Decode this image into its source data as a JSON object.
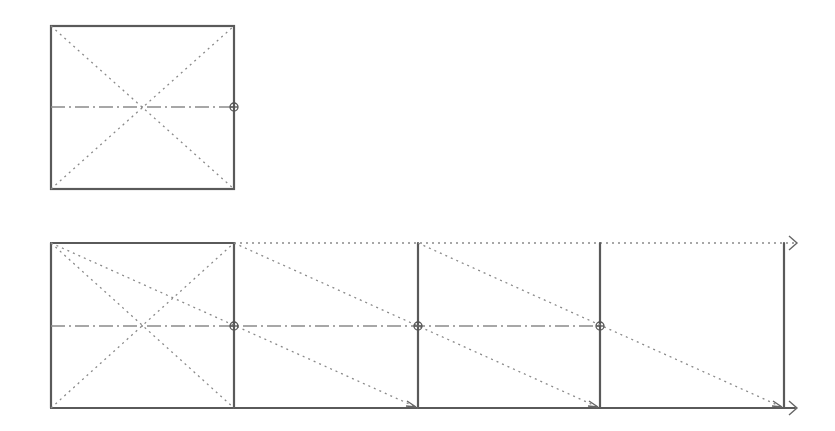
{
  "diagram": {
    "top_figure": {
      "label": "",
      "elements": [
        "square-outline",
        "diagonal-1",
        "diagonal-2",
        "center-line",
        "midpoint-marker"
      ]
    },
    "bottom_figure": {
      "label": "",
      "unit_count": 4,
      "midpoint_markers": 3,
      "arrows": [
        "top-guide-arrow",
        "bottom-guide-arrow"
      ]
    },
    "colors": {
      "line": "#5a5a5a",
      "guide": "#8a8a8a",
      "background": "#ffffff"
    }
  }
}
